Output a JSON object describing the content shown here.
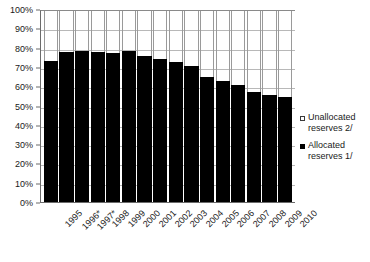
{
  "chart_data": {
    "type": "bar",
    "title": "",
    "subtitle": "",
    "xlabel": "",
    "ylabel": "",
    "ylim": [
      0,
      100
    ],
    "y_unit": "%",
    "stacked": true,
    "grid": true,
    "legend_position": "right",
    "y_ticks": [
      {
        "value": 100,
        "label": "100%"
      },
      {
        "value": 90,
        "label": "90%"
      },
      {
        "value": 80,
        "label": "80%"
      },
      {
        "value": 70,
        "label": "70%"
      },
      {
        "value": 60,
        "label": "60%"
      },
      {
        "value": 50,
        "label": "50%"
      },
      {
        "value": 40,
        "label": "40%"
      },
      {
        "value": 30,
        "label": "30%"
      },
      {
        "value": 20,
        "label": "20%"
      },
      {
        "value": 10,
        "label": "10%"
      },
      {
        "value": 0,
        "label": "0%"
      }
    ],
    "categories": [
      "1995",
      "1996*",
      "1997*",
      "1998",
      "1999",
      "2000",
      "2001",
      "2002",
      "2003",
      "2004",
      "2005",
      "2006",
      "2007",
      "2008",
      "2009",
      "2010"
    ],
    "series": [
      {
        "name": "Allocated reserves 1/",
        "color": "#000000",
        "values": [
          74,
          78.5,
          79,
          78.5,
          78,
          79,
          76.5,
          75,
          73.5,
          71,
          65.5,
          63.5,
          61.5,
          57.5,
          56,
          55
        ]
      },
      {
        "name": "Unallocated reserves 2/",
        "color": "#ffffff",
        "values": [
          26,
          21.5,
          21,
          21.5,
          22,
          21,
          23.5,
          25,
          26.5,
          29,
          34.5,
          36.5,
          38.5,
          42.5,
          44,
          45
        ]
      }
    ]
  },
  "legend": {
    "items": [
      {
        "marker": "hollow-square",
        "label": "Unallocated reserves 2/"
      },
      {
        "marker": "filled-square",
        "label": "Allocated reserves 1/"
      }
    ]
  }
}
